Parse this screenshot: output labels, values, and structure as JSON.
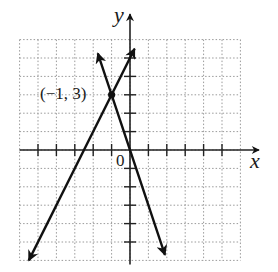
{
  "chart_data": {
    "type": "line",
    "title": "",
    "xlabel": "x",
    "ylabel": "y",
    "xlim": [
      -6,
      6
    ],
    "ylim": [
      -6,
      6
    ],
    "grid": true,
    "grid_style": "dotted",
    "tick_spacing": 1,
    "origin_label": "0",
    "series": [
      {
        "name": "line-1",
        "equation": "y = 2x + 5",
        "slope": 2,
        "intercept": 5,
        "x_range": [
          -5.5,
          0.25
        ],
        "arrows": "both"
      },
      {
        "name": "line-2",
        "equation": "y = -3x",
        "slope": -3,
        "intercept": 0,
        "x_range": [
          -1.75,
          1.9
        ],
        "arrows": "both"
      }
    ],
    "annotations": [
      {
        "text": "(−1, 3)",
        "x": -1,
        "y": 3,
        "marker": "filled-dot"
      }
    ],
    "legend": null
  },
  "labels": {
    "x_axis": "x",
    "y_axis": "y",
    "origin": "0",
    "intersection": "(−1, 3)"
  },
  "colors": {
    "line": "#111111",
    "axis": "#222222",
    "grid": "#9a9a9a"
  }
}
